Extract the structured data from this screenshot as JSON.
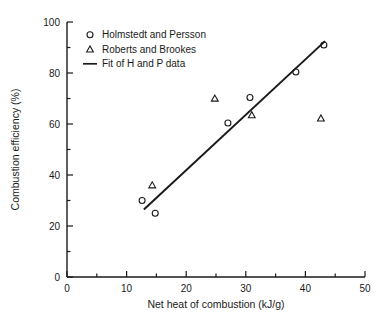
{
  "chart_data": {
    "type": "scatter",
    "title": "",
    "xlabel": "Net heat of combustion (kJ/g)",
    "ylabel": "Combustion efficiency (%)",
    "xlim": [
      0,
      50
    ],
    "ylim": [
      0,
      100
    ],
    "xticks": [
      0,
      10,
      20,
      30,
      40,
      50
    ],
    "yticks": [
      0,
      20,
      40,
      60,
      80,
      100
    ],
    "xticklabels": [
      "0",
      "10",
      "20",
      "30",
      "40",
      "50"
    ],
    "yticklabels": [
      "0",
      "20",
      "40",
      "60",
      "80",
      "100"
    ],
    "x_minor_tick_step": 5,
    "y_minor_tick_step": 10,
    "grid": false,
    "legend_position": "upper left",
    "series": [
      {
        "name": "Holmstedt and Persson",
        "marker": "circle",
        "color": "#1a1a1a",
        "points": [
          {
            "x": 12.6,
            "y": 30.0
          },
          {
            "x": 14.8,
            "y": 25.0
          },
          {
            "x": 27.0,
            "y": 60.4
          },
          {
            "x": 30.7,
            "y": 70.4
          },
          {
            "x": 38.4,
            "y": 80.4
          },
          {
            "x": 43.1,
            "y": 91.0
          }
        ]
      },
      {
        "name": "Roberts and Brookes",
        "marker": "triangle",
        "color": "#1a1a1a",
        "points": [
          {
            "x": 14.3,
            "y": 36.0
          },
          {
            "x": 24.8,
            "y": 70.0
          },
          {
            "x": 31.0,
            "y": 63.5
          },
          {
            "x": 42.6,
            "y": 62.2
          }
        ]
      },
      {
        "name": "Fit of H and P data",
        "marker": "line",
        "color": "#1a1a1a",
        "points": [
          {
            "x": 12.9,
            "y": 26.5
          },
          {
            "x": 43.3,
            "y": 92.5
          }
        ]
      }
    ],
    "legend": [
      {
        "label": "Holmstedt and Persson",
        "marker": "circle"
      },
      {
        "label": "Roberts and Brookes",
        "marker": "triangle"
      },
      {
        "label": "Fit of H and P data",
        "marker": "line"
      }
    ]
  },
  "axis_color": "#1a1a1a",
  "background": "#ffffff"
}
